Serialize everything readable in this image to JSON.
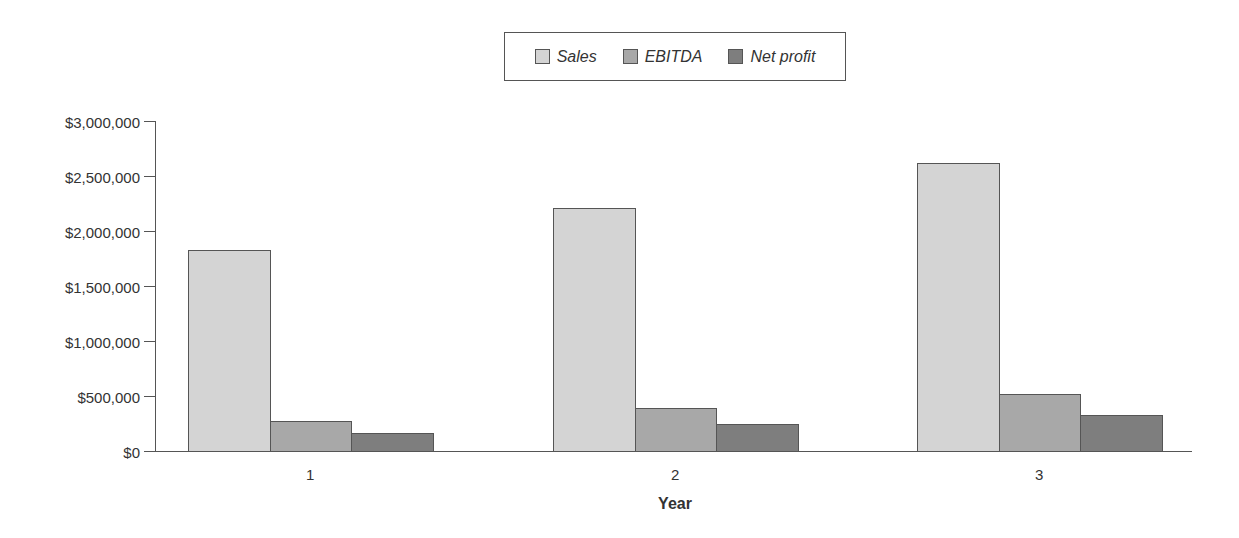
{
  "chart_data": {
    "type": "bar",
    "title": "",
    "xlabel": "Year",
    "ylabel": "",
    "categories": [
      "1",
      "2",
      "3"
    ],
    "series": [
      {
        "name": "Sales",
        "color": "#d4d4d4",
        "values": [
          1830000,
          2210000,
          2620000
        ]
      },
      {
        "name": "EBITDA",
        "color": "#a8a8a8",
        "values": [
          270000,
          390000,
          520000
        ]
      },
      {
        "name": "Net profit",
        "color": "#7e7e7e",
        "values": [
          160000,
          250000,
          330000
        ]
      }
    ],
    "ylim": [
      0,
      3000000
    ],
    "yticks": [
      "$0",
      "$500,000",
      "$1,000,000",
      "$1,500,000",
      "$2,000,000",
      "$2,500,000",
      "$3,000,000"
    ],
    "grid": false,
    "legend_position": "top-center"
  }
}
